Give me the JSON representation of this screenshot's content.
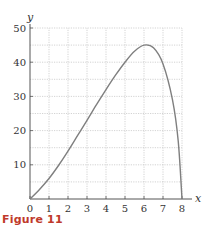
{
  "figure": {
    "caption": "Figure 11",
    "caption_color": "#c0392b"
  },
  "chart_data": {
    "type": "line",
    "title": "",
    "xlabel": "x",
    "ylabel": "y",
    "xlim": [
      0,
      8
    ],
    "ylim": [
      0,
      50
    ],
    "x_ticks": [
      0,
      1,
      2,
      3,
      4,
      5,
      6,
      7,
      8
    ],
    "y_ticks": [
      10,
      20,
      30,
      40,
      50
    ],
    "grid": true,
    "grid_style": "dotted",
    "grid_y_step": 5,
    "grid_x_step": 1,
    "legend": null,
    "series": [
      {
        "name": "curve",
        "color": "#7f7f7f",
        "x": [
          0,
          0.5,
          1,
          1.5,
          2,
          2.5,
          3,
          3.5,
          4,
          4.5,
          5,
          5.5,
          6,
          6.5,
          7,
          7.5,
          7.8,
          8
        ],
        "y": [
          0,
          2.8,
          6,
          9.8,
          14,
          18.5,
          23,
          27.6,
          32,
          36.2,
          40,
          43.2,
          45,
          44.2,
          39.5,
          29,
          17,
          0
        ]
      }
    ],
    "annotations": []
  }
}
